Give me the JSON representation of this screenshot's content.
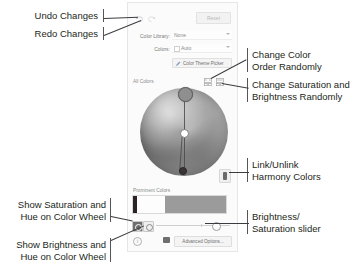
{
  "panel": {
    "toolbar": {
      "undo_icon": "undo-arrow-icon",
      "redo_icon": "redo-arrow-icon",
      "reset_label": "Reset"
    },
    "fields": [
      {
        "label": "Color Library:",
        "value": "None",
        "has_swatch": false
      },
      {
        "label": "Colors:",
        "value": "Auto",
        "has_swatch": true
      }
    ],
    "theme_picker": {
      "label": "Color Theme Picker",
      "icon": "eyedropper-icon"
    },
    "wheel_section": {
      "title": "All Colors",
      "randomize_order_icon": "dice-grid-icon",
      "randomize_saturation_icon": "dice-grid-icon",
      "handles": [
        "primary-handle",
        "center-handle",
        "secondary-handle"
      ]
    },
    "link_harmony": {
      "icon": "link-chain-icon",
      "state": "linked"
    },
    "prominent_colors": {
      "title": "Prominent Colors",
      "swatches": [
        {
          "name": "swatch-dark",
          "color": "#2b2226",
          "width_pct": 4
        },
        {
          "name": "swatch-white",
          "color": "#fdfdfd",
          "width_pct": 30
        },
        {
          "name": "swatch-gray",
          "color": "#9b9b9b",
          "width_pct": 66
        }
      ]
    },
    "bottom_bar": {
      "mode_saturation_icon": "saturation-hue-wheel-icon",
      "mode_brightness_icon": "brightness-hue-wheel-icon",
      "slider_name": "brightness-saturation-slider",
      "slider_value": 76,
      "info_icon": "info-icon",
      "palette_icon": "palette-icon",
      "advanced_options_label": "Advanced Options..."
    }
  },
  "annotations": {
    "undo": "Undo Changes",
    "redo": "Redo Changes",
    "change_color_order": "Change Color\nOrder Randomly",
    "change_saturation": "Change Saturation and\nBrightness Randomly",
    "link_unlink": "Link/Unlink\nHarmony Colors",
    "brightness_slider": "Brightness/\nSaturation slider",
    "show_saturation": "Show Saturation and\nHue on Color Wheel",
    "show_brightness": "Show Brightness and\nHue on Color Wheel"
  }
}
